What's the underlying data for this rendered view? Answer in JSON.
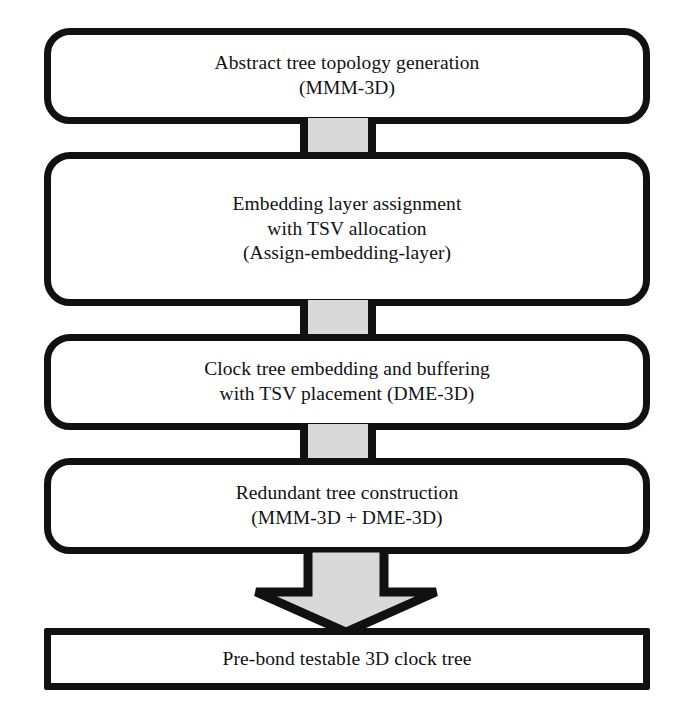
{
  "diagram": {
    "type": "flowchart",
    "orientation": "top-to-bottom",
    "colors": {
      "stroke": "#111111",
      "node_fill": "#ffffff",
      "connector_fill": "#d9d9d9",
      "arrow_fill": "#d9d9d9",
      "background": "#ffffff"
    },
    "nodes": [
      {
        "id": "node-1",
        "shape": "rounded-rectangle",
        "label": "Abstract tree topology generation\n(MMM-3D)",
        "line1": "Abstract tree topology generation",
        "line2": "(MMM-3D)"
      },
      {
        "id": "node-2",
        "shape": "rounded-rectangle",
        "label": "Embedding layer assignment\nwith TSV allocation\n(Assign-embedding-layer)",
        "line1": "Embedding layer assignment",
        "line2": "with TSV allocation",
        "line3": "(Assign-embedding-layer)"
      },
      {
        "id": "node-3",
        "shape": "rounded-rectangle",
        "label": "Clock tree embedding and buffering\nwith TSV placement (DME-3D)",
        "line1": "Clock tree embedding and buffering",
        "line2": "with TSV placement (DME-3D)"
      },
      {
        "id": "node-4",
        "shape": "rounded-rectangle",
        "label": "Redundant tree construction\n(MMM-3D + DME-3D)",
        "line1": "Redundant tree construction",
        "line2": "(MMM-3D + DME-3D)"
      },
      {
        "id": "node-5",
        "shape": "rectangle",
        "label": "Pre-bond testable 3D clock tree",
        "line1": "Pre-bond testable 3D clock tree"
      }
    ],
    "connectors": [
      {
        "id": "connector-1-2",
        "from": "node-1",
        "to": "node-2",
        "style": "bar"
      },
      {
        "id": "connector-2-3",
        "from": "node-2",
        "to": "node-3",
        "style": "bar"
      },
      {
        "id": "connector-3-4",
        "from": "node-3",
        "to": "node-4",
        "style": "bar"
      },
      {
        "id": "arrow-4-5",
        "from": "node-4",
        "to": "node-5",
        "style": "block-arrow-down"
      }
    ]
  }
}
